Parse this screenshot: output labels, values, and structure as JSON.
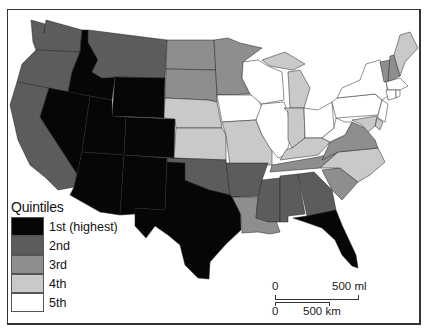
{
  "map": {
    "title": "",
    "type": "choropleth",
    "region": "Contiguous United States",
    "colors": {
      "q1": "#060606",
      "q2": "#5c5c5c",
      "q3": "#8e8e8e",
      "q4": "#c9c9c9",
      "q5": "#ffffff"
    },
    "states": {
      "WA": "q2",
      "OR": "q2",
      "CA": "q2",
      "ID": "q1",
      "NV": "q1",
      "MT": "q2",
      "WY": "q1",
      "UT": "q1",
      "AZ": "q1",
      "CO": "q1",
      "NM": "q1",
      "TX": "q1",
      "ND": "q3",
      "SD": "q3",
      "NE": "q4",
      "KS": "q4",
      "OK": "q2",
      "MN": "q3",
      "IA": "q5",
      "MO": "q4",
      "AR": "q2",
      "LA": "q3",
      "WI": "q5",
      "IL": "q5",
      "MI": "q4",
      "IN": "q4",
      "OH": "q5",
      "KY": "q4",
      "TN": "q3",
      "MS": "q2",
      "AL": "q2",
      "GA": "q2",
      "FL": "q1",
      "SC": "q3",
      "NC": "q4",
      "VA": "q3",
      "WV": "q5",
      "PA": "q5",
      "NY": "q5",
      "VT": "q3",
      "NH": "q3",
      "ME": "q4",
      "MA": "q5",
      "CT": "q5",
      "RI": "q5",
      "NJ": "q5",
      "DE": "q4",
      "MD": "q4"
    }
  },
  "legend": {
    "title": "Quintiles",
    "items": [
      {
        "key": "q1",
        "label": "1st (highest)"
      },
      {
        "key": "q2",
        "label": "2nd"
      },
      {
        "key": "q3",
        "label": "3rd"
      },
      {
        "key": "q4",
        "label": "4th"
      },
      {
        "key": "q5",
        "label": "5th"
      }
    ]
  },
  "scale_bar": {
    "miles_start": "0",
    "miles_end": "500 ml",
    "km_start": "0",
    "km_end": "500 km"
  }
}
